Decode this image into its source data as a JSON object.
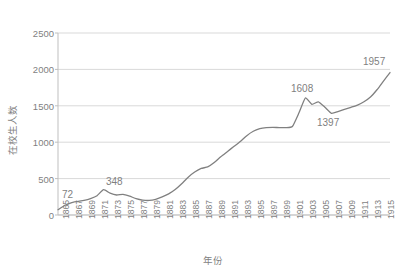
{
  "chart_data": {
    "type": "line",
    "title": "",
    "xlabel": "年份",
    "ylabel": "在校生人数",
    "xlim": [
      1865,
      1916
    ],
    "ylim": [
      0,
      2500
    ],
    "grid": true,
    "legend": "none",
    "series_color": "#808080",
    "ytick_labels": [
      "2500",
      "2000",
      "1500",
      "1000",
      "500",
      "0"
    ],
    "ytick_values": [
      2500,
      2000,
      1500,
      1000,
      500,
      0
    ],
    "xtick_labels": [
      "1865",
      "1867",
      "1869",
      "1871",
      "1873",
      "1875",
      "1877",
      "1879",
      "1881",
      "1883",
      "1885",
      "1887",
      "1889",
      "1891",
      "1893",
      "1895",
      "1897",
      "1899",
      "1901",
      "1903",
      "1905",
      "1907",
      "1909",
      "1911",
      "1913",
      "1915"
    ],
    "xtick_values": [
      1865,
      1867,
      1869,
      1871,
      1873,
      1875,
      1877,
      1879,
      1881,
      1883,
      1885,
      1887,
      1889,
      1891,
      1893,
      1895,
      1897,
      1899,
      1901,
      1903,
      1905,
      1907,
      1909,
      1911,
      1913,
      1915
    ],
    "series": [
      {
        "name": "在校生人数",
        "x": [
          1865,
          1866,
          1867,
          1868,
          1869,
          1870,
          1871,
          1872,
          1873,
          1874,
          1875,
          1876,
          1877,
          1878,
          1879,
          1880,
          1881,
          1882,
          1883,
          1884,
          1885,
          1886,
          1887,
          1888,
          1889,
          1890,
          1891,
          1892,
          1893,
          1894,
          1895,
          1896,
          1897,
          1898,
          1899,
          1900,
          1901,
          1902,
          1903,
          1904,
          1905,
          1906,
          1907,
          1908,
          1909,
          1910,
          1911,
          1912,
          1913,
          1914,
          1915,
          1916
        ],
        "values": [
          72,
          130,
          168,
          185,
          200,
          225,
          265,
          348,
          300,
          275,
          283,
          258,
          225,
          205,
          200,
          215,
          248,
          290,
          350,
          430,
          520,
          590,
          640,
          660,
          720,
          800,
          870,
          940,
          1010,
          1090,
          1150,
          1185,
          1200,
          1205,
          1200,
          1200,
          1215,
          1400,
          1608,
          1520,
          1555,
          1480,
          1397,
          1420,
          1452,
          1480,
          1510,
          1555,
          1620,
          1720,
          1840,
          1957
        ]
      }
    ],
    "annotations": [
      {
        "label": "72",
        "x": 1865,
        "y": 72
      },
      {
        "label": "348",
        "x": 1872,
        "y": 348
      },
      {
        "label": "1608",
        "x": 1903,
        "y": 1608
      },
      {
        "label": "1397",
        "x": 1907,
        "y": 1397
      },
      {
        "label": "1957",
        "x": 1916,
        "y": 1957
      }
    ]
  },
  "axes": {
    "y_title": "在校生人数",
    "x_title": "年份"
  }
}
